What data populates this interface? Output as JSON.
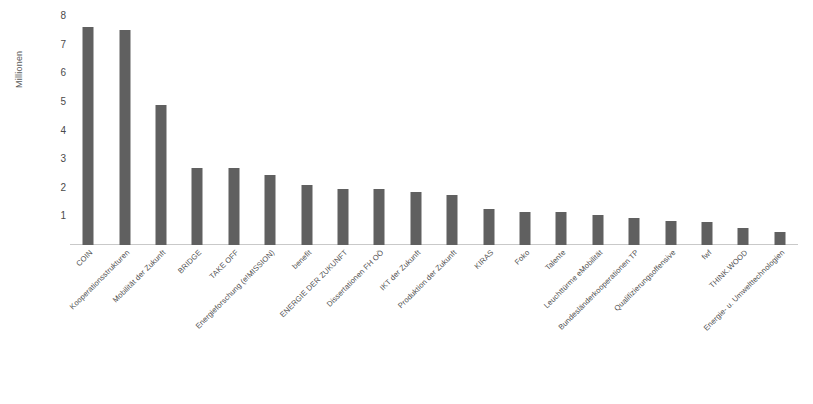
{
  "chart_data": {
    "type": "bar",
    "title": "",
    "subtitle": "",
    "xlabel": "",
    "ylabel": "Millionen",
    "ylim": [
      0,
      8
    ],
    "yticks": [
      1,
      2,
      3,
      4,
      5,
      6,
      7,
      8
    ],
    "ytick_labels": [
      "1",
      "2",
      "3",
      "4",
      "5",
      "6",
      "7",
      "8"
    ],
    "grid": false,
    "legend": false,
    "legend_position": "none",
    "bar_color": "#606060",
    "axis_color": "#c9c9c9",
    "categories": [
      "COIN",
      "Kooperationsstrukturen",
      "Mobilität der Zukunft",
      "BRIDGE",
      "TAKE OFF",
      "Energieforschung (e!MISSION)",
      "benefit",
      "ENERGIE DER ZUKUNFT",
      "Dissertationen FH OÖ",
      "IKT der Zukunft",
      "Produktion der Zukunft",
      "KIRAS",
      "Foko",
      "Talente",
      "Leuchttürme eMobilität",
      "Bundesländerkooperationen TP",
      "Qualifizierungsoffensive",
      "fwf",
      "THINK.WOOD",
      "Energie- u. Umwelttechnologien"
    ],
    "values": [
      7.6,
      7.5,
      4.9,
      2.7,
      2.7,
      2.45,
      2.1,
      1.95,
      1.95,
      1.85,
      1.75,
      1.25,
      1.15,
      1.15,
      1.05,
      0.95,
      0.85,
      0.8,
      0.6,
      0.45
    ]
  }
}
